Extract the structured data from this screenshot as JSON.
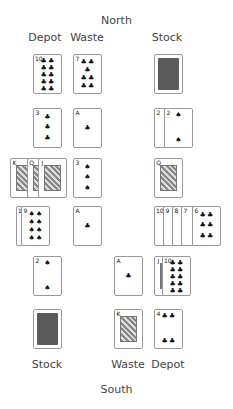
{
  "labels": {
    "north": "North",
    "south": "South",
    "north_depot": "Depot",
    "north_waste": "Waste",
    "north_stock": "Stock",
    "south_stock": "Stock",
    "south_waste": "Waste",
    "south_depot": "Depot"
  },
  "colors": {
    "card_back": "#5a5a5a",
    "card_border": "#999999",
    "text": "#444444"
  },
  "north": {
    "depot": {
      "rank": "10",
      "suit": "♣"
    },
    "waste": {
      "rank": "7",
      "suit": "♣"
    },
    "stock": {
      "face": "down"
    }
  },
  "rows": [
    {
      "left": [
        {
          "rank": "3",
          "suit": "♣"
        }
      ],
      "mid": [
        {
          "rank": "A",
          "suit": "♣"
        }
      ],
      "right": [
        {
          "rank": "2",
          "suit": "♠"
        },
        {
          "rank": "2",
          "suit": "♠"
        }
      ]
    },
    {
      "left": [
        {
          "rank": "K",
          "suit": "♠"
        },
        {
          "rank": "Q",
          "suit": "♠"
        },
        {
          "rank": "J",
          "suit": "♠"
        }
      ],
      "mid": [
        {
          "rank": "3",
          "suit": "♠"
        }
      ],
      "right": [
        {
          "rank": "Q",
          "suit": "♠"
        }
      ]
    },
    {
      "left": [
        {
          "rank": "10",
          "suit": "♠"
        },
        {
          "rank": "9",
          "suit": "♠"
        }
      ],
      "mid": [
        {
          "rank": "A",
          "suit": "♣"
        }
      ],
      "right": [
        {
          "rank": "10",
          "suit": "♠"
        },
        {
          "rank": "9",
          "suit": "♣"
        },
        {
          "rank": "8",
          "suit": "♣"
        },
        {
          "rank": "7",
          "suit": "♠"
        },
        {
          "rank": "6",
          "suit": "♣"
        }
      ]
    },
    {
      "left": [
        {
          "rank": "2",
          "suit": "♠"
        }
      ],
      "mid2": [
        {
          "rank": "A",
          "suit": "♣"
        }
      ],
      "right": [
        {
          "rank": "J",
          "suit": "♣"
        },
        {
          "rank": "10",
          "suit": "♣"
        }
      ]
    }
  ],
  "south": {
    "stock": {
      "face": "down"
    },
    "waste": {
      "rank": "K",
      "suit": "♣"
    },
    "depot": {
      "rank": "4",
      "suit": "♣"
    }
  }
}
